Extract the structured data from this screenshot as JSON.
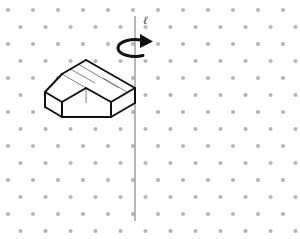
{
  "figure": {
    "background_color": "#ffffff",
    "grid": {
      "name": "isometric-dot-grid",
      "dot_color": "#b6b6b9",
      "dot_radius": 2.1,
      "column_spacing": 25,
      "row_spacing": 17,
      "stagger": "half-column offset on alternate rows",
      "x_start": 8,
      "y_start": 10,
      "columns": 12,
      "rows": 14
    },
    "axis": {
      "name": "rotation-axis-line",
      "label": "ℓ",
      "label_x": 143,
      "label_y": 24,
      "color": "#9a9a9e",
      "width": 1.4,
      "x": 135,
      "y_top": 16,
      "y_bottom": 221
    },
    "rotation_arrow": {
      "name": "rotation-direction-arrow",
      "color": "#111111",
      "stroke_width": 3,
      "center_x": 135,
      "center_y": 48,
      "radius_x": 17,
      "radius_y": 8,
      "direction": "clockwise-viewed-from-above",
      "arrowhead": "right"
    },
    "solid": {
      "name": "l-shaped-block",
      "outline_color": "#111111",
      "interior_color": "#6d6d72",
      "outline_width": 2.0,
      "interior_width": 0.85,
      "top_face_fill": "#ffffff",
      "left_face_fill": "#ffffff",
      "right_face_fill": "#ffffff",
      "cube_count": 4,
      "description": "Four unit cubes arranged in an L: a row of three cubes plus one cube stepped forward at the left end"
    }
  }
}
